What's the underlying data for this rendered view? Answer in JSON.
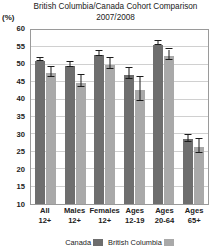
{
  "title": {
    "line1": "British Columbia/Canada Cohort Comparison",
    "line2": "2007/2008"
  },
  "axis": {
    "unit_label": "(%)"
  },
  "legend": {
    "items": [
      {
        "label": "Canada",
        "color": "#6e6e6e"
      },
      {
        "label": "British Columbia",
        "color": "#a9a9a9"
      }
    ]
  },
  "chart_data": {
    "type": "bar",
    "title": "British Columbia/Canada Cohort Comparison 2007/2008",
    "subtitle": "2007/2008",
    "xlabel": "",
    "ylabel": "(%)",
    "ylim": [
      10,
      60
    ],
    "yticks": [
      10,
      15,
      20,
      25,
      30,
      35,
      40,
      45,
      50,
      55,
      60
    ],
    "grid": true,
    "legend_position": "bottom",
    "categories": [
      "All 12+",
      "Males 12+",
      "Females 12+",
      "Ages 12-19",
      "Ages 20-64",
      "Ages 65+"
    ],
    "category_lines": [
      [
        "All",
        "12+"
      ],
      [
        "Males",
        "12+"
      ],
      [
        "Females",
        "12+"
      ],
      [
        "Ages",
        "12-19"
      ],
      [
        "Ages",
        "20-64"
      ],
      [
        "Ages",
        "65+"
      ]
    ],
    "series": [
      {
        "name": "Canada",
        "color": "#6e6e6e",
        "values": [
          51.1,
          49.6,
          52.7,
          47.1,
          55.8,
          28.7
        ],
        "error_low": [
          50.6,
          48.9,
          52.0,
          45.6,
          55.2,
          27.7
        ],
        "error_high": [
          51.6,
          50.3,
          53.4,
          48.6,
          56.4,
          29.7
        ]
      },
      {
        "name": "British Columbia",
        "color": "#a9a9a9",
        "values": [
          47.6,
          44.9,
          49.9,
          42.7,
          52.4,
          26.5
        ],
        "error_low": [
          46.2,
          43.2,
          48.3,
          39.4,
          50.9,
          24.5
        ],
        "error_high": [
          49.0,
          46.6,
          51.5,
          46.0,
          53.9,
          28.5
        ]
      }
    ]
  }
}
